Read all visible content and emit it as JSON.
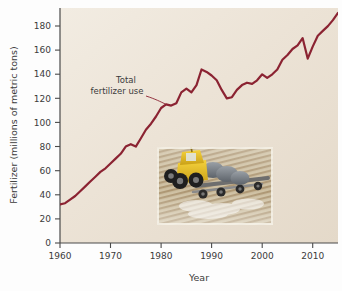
{
  "figure": {
    "background_color": "#fdfdfd",
    "plot_background_color": "#efe7dc",
    "line_color": "#8b2332",
    "axis_color": "#4a4a4a",
    "text_color": "#3b3b3b"
  },
  "chart_data": {
    "type": "line",
    "title": "",
    "subtitle": "",
    "xlabel": "Year",
    "ylabel": "Fertilizer (millions of metric tons)",
    "xlim": [
      1960,
      2015
    ],
    "ylim": [
      0,
      195
    ],
    "grid": false,
    "legend_position": "none",
    "xticks": [
      1960,
      1970,
      1980,
      1990,
      2000,
      2010
    ],
    "xtick_labels": [
      "1960",
      "1970",
      "1980",
      "1990",
      "2000",
      "2010"
    ],
    "yticks": [
      0,
      20,
      40,
      60,
      80,
      100,
      120,
      140,
      160,
      180
    ],
    "ytick_labels": [
      "0",
      "20",
      "40",
      "60",
      "80",
      "100",
      "120",
      "140",
      "160",
      "180"
    ],
    "series": [
      {
        "name": "Total fertilizer use",
        "color": "#8b2332",
        "x": [
          1960,
          1961,
          1962,
          1963,
          1964,
          1965,
          1966,
          1967,
          1968,
          1969,
          1970,
          1971,
          1972,
          1973,
          1974,
          1975,
          1976,
          1977,
          1978,
          1979,
          1980,
          1981,
          1982,
          1983,
          1984,
          1985,
          1986,
          1987,
          1988,
          1989,
          1990,
          1991,
          1992,
          1993,
          1994,
          1995,
          1996,
          1997,
          1998,
          1999,
          2000,
          2001,
          2002,
          2003,
          2004,
          2005,
          2006,
          2007,
          2008,
          2009,
          2010,
          2011,
          2012,
          2013,
          2014,
          2015
        ],
        "values": [
          32,
          33,
          36,
          39,
          43,
          47,
          51,
          55,
          59,
          62,
          66,
          70,
          74,
          80,
          82,
          80,
          87,
          94,
          99,
          105,
          112,
          115,
          114,
          116,
          125,
          128,
          125,
          131,
          144,
          142,
          139,
          135,
          127,
          120,
          121,
          127,
          131,
          133,
          132,
          135,
          140,
          137,
          140,
          144,
          152,
          156,
          161,
          164,
          170,
          153,
          163,
          172,
          176,
          180,
          185,
          191
        ],
        "annotation": {
          "label_line1": "Total",
          "label_line2": "fertilizer use",
          "points_to_year": 1981,
          "points_to_value": 115
        }
      }
    ]
  },
  "inset": {
    "name": "fertilizer-spreader-photo",
    "description": "Yellow fertilizer spreader truck on a plowed field"
  }
}
